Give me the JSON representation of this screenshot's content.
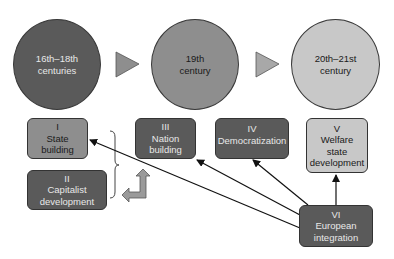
{
  "diagram": {
    "periods": [
      {
        "id": "p1",
        "line1": "16th–18th",
        "line2": "centuries",
        "fill": "#5a5a5a",
        "text_color": "#e8e8e8"
      },
      {
        "id": "p2",
        "line1": "19th",
        "line2": "century",
        "fill": "#8e8e8e",
        "text_color": "#1a1a1a"
      },
      {
        "id": "p3",
        "line1": "20th–21st",
        "line2": "century",
        "fill": "#c8c8c8",
        "text_color": "#1a1a1a"
      }
    ],
    "processes": [
      {
        "numeral": "I",
        "line1": "State",
        "line2": "building"
      },
      {
        "numeral": "II",
        "line1": "Capitalist",
        "line2": "development"
      },
      {
        "numeral": "III",
        "line1": "Nation",
        "line2": "building"
      },
      {
        "numeral": "IV",
        "line1": "Democratization",
        "line2": ""
      },
      {
        "numeral": "V",
        "line1": "Welfare",
        "line2": "state",
        "line3": "development"
      },
      {
        "numeral": "VI",
        "line1": "European",
        "line2": "integration"
      }
    ],
    "connections": [
      {
        "from": "VI",
        "to": "I",
        "type": "arrow"
      },
      {
        "from": "VI",
        "to": "III",
        "type": "arrow"
      },
      {
        "from": "VI",
        "to": "IV",
        "type": "arrow"
      },
      {
        "from": "VI",
        "to": "V",
        "type": "arrow"
      },
      {
        "from": "I+II",
        "to": "III",
        "type": "brace-bent-arrow"
      }
    ]
  }
}
